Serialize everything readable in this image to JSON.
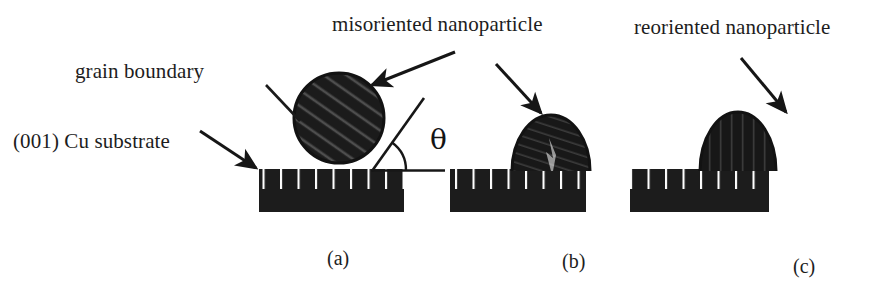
{
  "figure": {
    "background_color": "#ffffff",
    "ink_color": "#1a1a1a",
    "particle_fill": "#1c1c1c",
    "substrate_fill": "#1c1c1c"
  },
  "labels": {
    "grain_boundary": "grain boundary",
    "cu_substrate": "(001) Cu substrate",
    "misoriented_nanoparticle": "misoriented nanoparticle",
    "reoriented_nanoparticle": "reoriented nanoparticle",
    "theta": "θ"
  },
  "panels": [
    {
      "id": "a",
      "caption": "(a)",
      "particle_shape": "sphere",
      "particle_texture": "diagonal-hatching",
      "annotation": "misoriented nanoparticle sphere resting on substrate with contact angle theta",
      "has_theta_angle": true
    },
    {
      "id": "b",
      "caption": "(b)",
      "particle_shape": "flattened-dome",
      "particle_texture": "irregular-crack",
      "annotation": "partially reoriented nanoparticle spreading on substrate",
      "has_theta_angle": false
    },
    {
      "id": "c",
      "caption": "(c)",
      "particle_shape": "dome",
      "particle_texture": "vertical-striations",
      "annotation": "reoriented nanoparticle epitaxially aligned with substrate",
      "has_theta_angle": false
    }
  ]
}
